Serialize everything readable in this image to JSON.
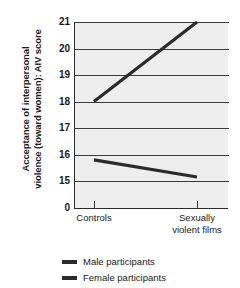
{
  "chart_data": {
    "type": "line",
    "title": "",
    "xlabel": "",
    "ylabel": "Acceptance of interpersonal violence (toward women): AIV score",
    "ylabel_line1": "Acceptance of interpersonal",
    "ylabel_line2": "violence (toward women): AIV score",
    "categories": [
      "Controls",
      "Sexually violent films"
    ],
    "x": [
      0,
      1
    ],
    "ylim": [
      15,
      21
    ],
    "yticks": [
      21,
      20,
      19,
      18,
      17,
      16,
      15,
      0
    ],
    "ytick_labels": [
      "21",
      "20",
      "19",
      "18",
      "17",
      "16",
      "15",
      "0"
    ],
    "axis_break": true,
    "grid": true,
    "legend_position": "bottom",
    "series": [
      {
        "name": "Male participants",
        "values": [
          18.0,
          21.0
        ],
        "color": "#2b2b2b"
      },
      {
        "name": "Female participants",
        "values": [
          15.8,
          15.15
        ],
        "color": "#2b2b2b"
      }
    ]
  },
  "axis": {
    "y_title_line1": "Acceptance of interpersonal",
    "y_title_line2": "violence (toward women): AIV score",
    "y_ticks": [
      {
        "label": "21"
      },
      {
        "label": "20"
      },
      {
        "label": "19"
      },
      {
        "label": "18"
      },
      {
        "label": "17"
      },
      {
        "label": "16"
      },
      {
        "label": "15"
      },
      {
        "label": "0"
      }
    ],
    "x_ticks": [
      {
        "label": "Controls"
      },
      {
        "label_line1": "Sexually",
        "label_line2": "violent films"
      }
    ]
  },
  "legend": {
    "items": [
      {
        "label": "Male participants"
      },
      {
        "label": "Female participants"
      }
    ]
  },
  "colors": {
    "panel_background": "#eeeeee",
    "page_background": "#ffffff",
    "line": "#2b2b2b",
    "grid": "#3a3a3a",
    "text": "#1a1a1a"
  }
}
